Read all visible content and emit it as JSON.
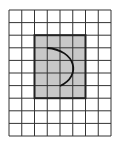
{
  "diagram": {
    "type": "grid-figure",
    "grid": {
      "columns": 8,
      "rows": 10,
      "origin_x": 9,
      "origin_y": 10,
      "cell_w": 12.75,
      "cell_h": 12.6,
      "line_color": "#333333",
      "background": "#ffffff"
    },
    "shaded_rect": {
      "col_start": 2,
      "row_start": 2,
      "cols": 4,
      "rows": 5,
      "fill": "#c8c8c8",
      "stroke": "#222222"
    },
    "arc": {
      "description": "semicircular arc bulging right inside shaded rectangle",
      "start": [
        47,
        48
      ],
      "control": [
        80,
        62
      ],
      "end": [
        60,
        86
      ],
      "stroke": "#111111"
    }
  }
}
